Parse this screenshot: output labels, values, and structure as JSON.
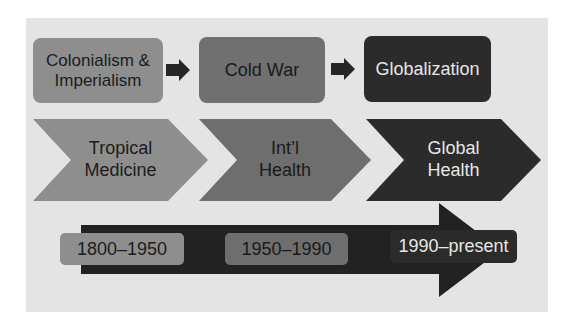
{
  "diagram": {
    "eras": [
      {
        "label": "Colonialism & Imperialism",
        "line1": "Colonialism &",
        "line2": "Imperialism",
        "color": "#8e8e8e"
      },
      {
        "label": "Cold War",
        "color": "#707070"
      },
      {
        "label": "Globalization",
        "color": "#2b2b2b"
      }
    ],
    "fields": [
      {
        "line1": "Tropical",
        "line2": "Medicine",
        "color": "#8e8e8e"
      },
      {
        "line1": "Int’l",
        "line2": "Health",
        "color": "#6e6e6e"
      },
      {
        "line1": "Global",
        "line2": "Health",
        "color": "#2b2b2b"
      }
    ],
    "periods": [
      {
        "label": "1800–1950",
        "color": "#8e8e8e"
      },
      {
        "label": "1950–1990",
        "color": "#6e6e6e"
      },
      {
        "label": "1990–present",
        "color": "#2b2b2b"
      }
    ],
    "connector_icon": "right-arrow-icon",
    "timeline_icon": "timeline-arrow-icon",
    "panel_color": "#e4e4e4",
    "arrow_color": "#222222"
  }
}
